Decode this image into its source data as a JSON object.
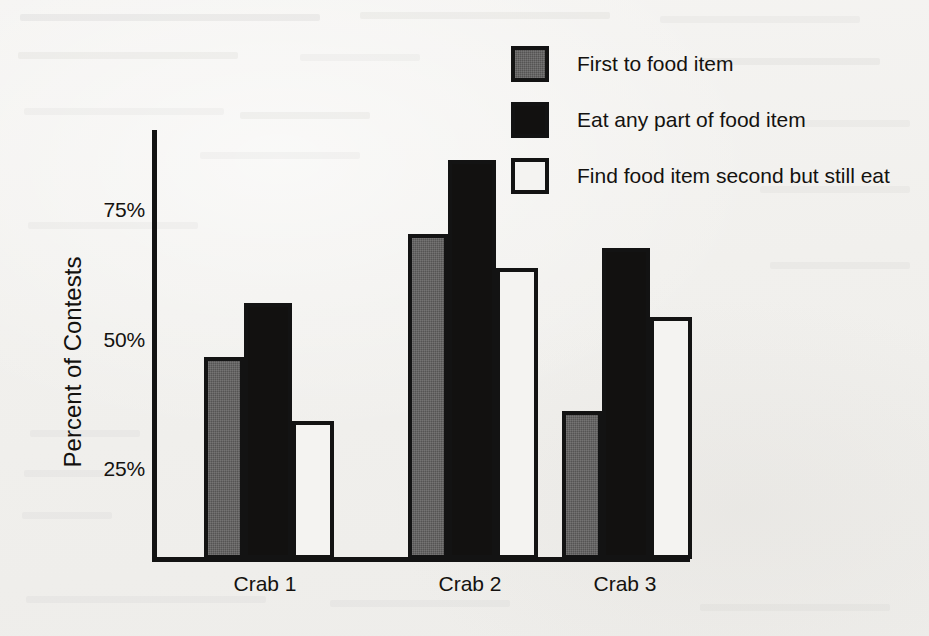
{
  "chart_data": {
    "type": "bar",
    "title": "",
    "xlabel": "",
    "ylabel": "Percent of Contests",
    "categories": [
      "Crab 1",
      "Crab 2",
      "Crab 3"
    ],
    "series": [
      {
        "name": "First to food item",
        "color": "#555453",
        "values": [
          41,
          66,
          30
        ]
      },
      {
        "name": "Eat any part of food item",
        "color": "#121110",
        "values": [
          52,
          81,
          63
        ]
      },
      {
        "name": "Find food item second but still eat",
        "color": "#f4f3f1",
        "values": [
          28,
          59,
          49
        ]
      }
    ],
    "ylim": [
      0,
      87
    ],
    "y_ticks": [
      25,
      50,
      75
    ],
    "y_tick_labels": [
      "25%",
      "50%",
      "75%"
    ],
    "grid": false,
    "legend_position": "top-right",
    "bar_gap_between_series": 0,
    "axis_color": "#131313"
  },
  "axis": {
    "ylabel": "Percent of Contests",
    "tick_75": "75%",
    "tick_50": "50%",
    "tick_25": "25%"
  },
  "categories": {
    "c0": "Crab 1",
    "c1": "Crab 2",
    "c2": "Crab 3"
  },
  "legend": {
    "items": [
      {
        "label": "First to food item",
        "swatch": "gray-filled-square"
      },
      {
        "label": "Eat any part of food item",
        "swatch": "black-filled-square"
      },
      {
        "label": "Find food item second but still eat",
        "swatch": "white-outlined-square"
      }
    ],
    "item0": "First to food item",
    "item1": "Eat any part of food item",
    "item2": "Find food item second but still eat"
  }
}
